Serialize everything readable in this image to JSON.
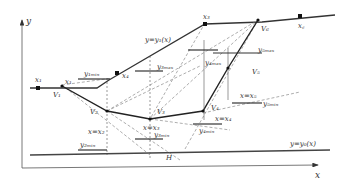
{
  "diagram": {
    "axes": {
      "x_label": "x",
      "y_label": "y"
    },
    "curves": {
      "upper_boundary": "y=y₁(x)",
      "lower_boundary": "y=y₀(x)"
    },
    "points": {
      "x1": "x₁",
      "x2": "x₂",
      "x3": "x₃",
      "x4": "x₄",
      "xc": "x꜀",
      "x_left": "x₁"
    },
    "vertices": {
      "V1": "V₁",
      "V2": "V₂",
      "V3": "V₃",
      "V4": "V₄",
      "V5": "V₅",
      "V6": "V₆"
    },
    "constraints": {
      "y1min": "y₁ₘᵢₙ",
      "y2min": "y₂ₘᵢₙ",
      "y3min": "y₃ₘᵢₙ",
      "y3max": "y₃ₘₐₓ",
      "y4min": "y₄ₘᵢₙ",
      "y4max": "y₄ₘₐₓ",
      "y5min": "y₅ₘᵢₙ",
      "y5max": "y₅ₘₐₓ"
    },
    "vertical_labels": {
      "x_eq_x2": "x=x₂",
      "x_eq_x3": "x=x₃",
      "x_eq_x4": "x=x₄",
      "x_eq_x5": "x=x₅"
    },
    "marker_H": "H"
  }
}
